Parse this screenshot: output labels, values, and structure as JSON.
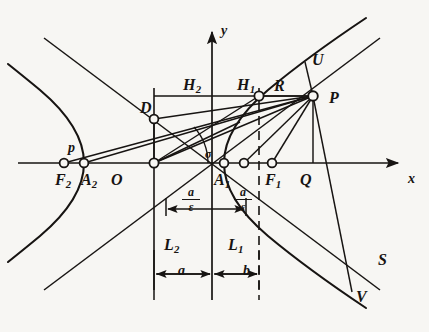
{
  "figure": {
    "kind": "hyperbola-geometry-diagram",
    "background_color": "#f7f6f3",
    "ink_color": "#171412",
    "axes": {
      "x_label": "x",
      "y_label": "y",
      "origin_label": "O"
    },
    "points": [
      {
        "id": "F2",
        "label": "F",
        "sub": "2",
        "x": 64,
        "y": 163,
        "marker": "circle"
      },
      {
        "id": "A2",
        "label": "A",
        "sub": "2",
        "x": 84,
        "y": 163,
        "marker": "circle"
      },
      {
        "id": "O",
        "label": "O",
        "sub": "",
        "x": 154,
        "y": 163,
        "marker": "circle"
      },
      {
        "id": "A1",
        "label": "A",
        "sub": "1",
        "x": 224,
        "y": 163,
        "marker": "circle"
      },
      {
        "id": "F1",
        "label": "F",
        "sub": "1",
        "x": 244,
        "y": 163,
        "marker": "circle"
      },
      {
        "id": "Q",
        "label": "Q",
        "sub": "",
        "x": 272,
        "y": 163,
        "marker": "circle"
      },
      {
        "id": "P",
        "label": "P",
        "sub": "",
        "x": 313,
        "y": 96,
        "marker": "circle"
      },
      {
        "id": "R",
        "label": "R",
        "sub": "",
        "x": 259,
        "y": 96,
        "marker": "circle"
      },
      {
        "id": "D",
        "label": "D",
        "sub": "",
        "x": 154,
        "y": 119,
        "marker": "circle"
      },
      {
        "id": "U",
        "label": "U",
        "sub": "",
        "x": 316,
        "y": 58,
        "marker": "none"
      },
      {
        "id": "S",
        "label": "S",
        "sub": "",
        "x": 372,
        "y": 258,
        "marker": "none"
      },
      {
        "id": "V",
        "label": "V",
        "sub": "",
        "x": 352,
        "y": 295,
        "marker": "none"
      }
    ],
    "labels": [
      {
        "name": "label-y-axis",
        "text": "y",
        "sub": "",
        "x": 221,
        "y": 24,
        "size": "sz-med"
      },
      {
        "name": "label-x-axis",
        "text": "x",
        "sub": "",
        "x": 408,
        "y": 172,
        "size": "sz-med"
      },
      {
        "name": "label-H2",
        "text": "H",
        "sub": "2",
        "x": 183,
        "y": 77,
        "size": "sz-big"
      },
      {
        "name": "label-H1",
        "text": "H",
        "sub": "1",
        "x": 237,
        "y": 77,
        "size": "sz-big"
      },
      {
        "name": "label-R",
        "text": "R",
        "sub": "",
        "x": 274,
        "y": 78,
        "size": "sz-big"
      },
      {
        "name": "label-U",
        "text": "U",
        "sub": "",
        "x": 312,
        "y": 52,
        "size": "sz-big"
      },
      {
        "name": "label-P",
        "text": "P",
        "sub": "",
        "x": 329,
        "y": 90,
        "size": "sz-big"
      },
      {
        "name": "label-D",
        "text": "D",
        "sub": "",
        "x": 140,
        "y": 100,
        "size": "sz-big"
      },
      {
        "name": "label-p",
        "text": "p",
        "sub": "",
        "x": 68,
        "y": 141,
        "size": "sz-med"
      },
      {
        "name": "label-F2",
        "text": "F",
        "sub": "2",
        "x": 55,
        "y": 172,
        "size": "sz-big"
      },
      {
        "name": "label-A2",
        "text": "A",
        "sub": "2",
        "x": 81,
        "y": 172,
        "size": "sz-big"
      },
      {
        "name": "label-O",
        "text": "O",
        "sub": "",
        "x": 111,
        "y": 172,
        "size": "sz-big"
      },
      {
        "name": "label-A1",
        "text": "A",
        "sub": "1",
        "x": 214,
        "y": 172,
        "size": "sz-big"
      },
      {
        "name": "label-F1",
        "text": "F",
        "sub": "1",
        "x": 265,
        "y": 172,
        "size": "sz-big"
      },
      {
        "name": "label-Q",
        "text": "Q",
        "sub": "",
        "x": 300,
        "y": 172,
        "size": "sz-big"
      },
      {
        "name": "label-L2",
        "text": "L",
        "sub": "2",
        "x": 164,
        "y": 237,
        "size": "sz-big"
      },
      {
        "name": "label-L1",
        "text": "L",
        "sub": "1",
        "x": 228,
        "y": 237,
        "size": "sz-big"
      },
      {
        "name": "label-sigma",
        "text": "σ",
        "sub": "",
        "x": 205,
        "y": 148,
        "size": "sz-sm"
      },
      {
        "name": "label-S",
        "text": "S",
        "sub": "",
        "x": 378,
        "y": 252,
        "size": "sz-big"
      },
      {
        "name": "label-V",
        "text": "V",
        "sub": "",
        "x": 356,
        "y": 289,
        "size": "sz-big"
      },
      {
        "name": "label-dim-a",
        "text": "a",
        "sub": "",
        "x": 178,
        "y": 264,
        "size": "sz-med"
      },
      {
        "name": "label-dim-b",
        "text": "b",
        "sub": "",
        "x": 243,
        "y": 264,
        "size": "sz-med"
      }
    ],
    "fractions": [
      {
        "name": "fraction-a-over-epsilon-left",
        "numerator": "a",
        "denominator": "ε",
        "x": 182,
        "y": 186
      },
      {
        "name": "fraction-a-over-epsilon-right",
        "numerator": "a",
        "denominator": "ε",
        "x": 234,
        "y": 186
      }
    ]
  }
}
